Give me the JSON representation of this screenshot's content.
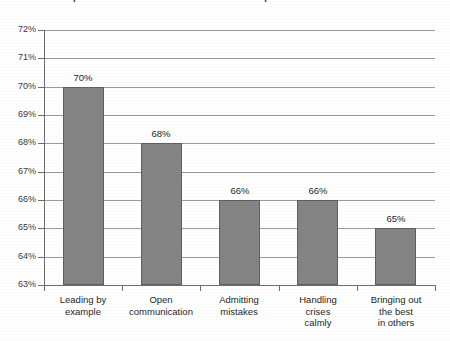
{
  "chart_data": {
    "type": "bar",
    "title": "Most Important Attributes for Effective Leadership",
    "title_clipped": true,
    "xlabel": "",
    "ylabel": "",
    "ylim": [
      63,
      72
    ],
    "ytick_step": 1,
    "grid": true,
    "legend": "none",
    "orientation": "vertical",
    "categories": [
      "Leading by example",
      "Open communication",
      "Admitting mistakes",
      "Handling crises calmly",
      "Bringing out the best in others"
    ],
    "values": [
      70,
      68,
      66,
      66,
      65
    ],
    "value_labels": [
      "70%",
      "68%",
      "66%",
      "66%",
      "65%"
    ],
    "ytick_labels": [
      "72%",
      "71%",
      "70%",
      "69%",
      "68%",
      "67%",
      "66%",
      "65%",
      "64%",
      "63%"
    ],
    "ytick_values": [
      72,
      71,
      70,
      69,
      68,
      67,
      66,
      65,
      64,
      63
    ],
    "bar_color": "#848484",
    "bar_edge_color": "#5f5f5f",
    "gridline_color": "#9a9a9a",
    "axis_color": "#6e6e6e",
    "background_color": "#ffffff"
  },
  "category_lines": [
    [
      "Leading by",
      "example"
    ],
    [
      "Open",
      "communication"
    ],
    [
      "Admitting",
      "mistakes"
    ],
    [
      "Handling",
      "crises",
      "calmly"
    ],
    [
      "Bringing out",
      "the best",
      "in others"
    ]
  ]
}
